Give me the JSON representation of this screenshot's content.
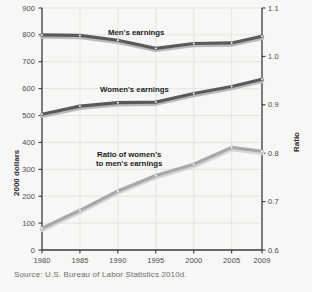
{
  "chart_data": {
    "type": "line",
    "title": "",
    "xlabel": "",
    "ylabel": "2000 dollars",
    "y2label": "Ratio",
    "x": [
      1980,
      1985,
      1990,
      1995,
      2000,
      2005,
      2009
    ],
    "xticklabels": [
      "1980",
      "1985",
      "1990",
      "1995",
      "2000",
      "2005",
      "2009"
    ],
    "xlim": [
      1980,
      2009
    ],
    "ylim": [
      0,
      900
    ],
    "yticks": [
      0,
      100,
      200,
      300,
      400,
      500,
      600,
      700,
      800,
      900
    ],
    "yticklabels": [
      "0",
      "100",
      "200",
      "300",
      "400",
      "500",
      "600",
      "700",
      "800",
      "900"
    ],
    "y2lim": [
      0.6,
      1.1
    ],
    "y2ticks": [
      0.6,
      0.7,
      0.8,
      0.9,
      1.0,
      1.1
    ],
    "y2ticklabels": [
      "0.6",
      "0.7",
      "0.8",
      "0.9",
      "1.0",
      "1.1"
    ],
    "grid": true,
    "legend_position": "inline-labels",
    "series": [
      {
        "name": "Men's earnings",
        "axis": "left",
        "color": "#5a5a5a",
        "values": [
          800,
          798,
          780,
          750,
          768,
          770,
          795
        ]
      },
      {
        "name": "Women's earnings",
        "axis": "left",
        "color": "#5a5a5a",
        "values": [
          505,
          535,
          548,
          550,
          582,
          608,
          635
        ]
      },
      {
        "name": "Ratio of women's to men's earnings",
        "axis": "right",
        "color": "#a8a8a8",
        "values": [
          0.645,
          0.682,
          0.722,
          0.754,
          0.777,
          0.812,
          0.804
        ]
      }
    ],
    "annotations": [
      {
        "text": "Men's earnings",
        "x": 1991.5,
        "y": 845
      },
      {
        "text": "Women's earnings",
        "x": 1990.5,
        "y": 607
      },
      {
        "text": "Ratio of women's",
        "x": 1990.0,
        "y": 390
      },
      {
        "text": "to men's earnings",
        "x": 1990.0,
        "y": 362
      }
    ]
  },
  "labels": {
    "y_axis_title": "2000 dollars",
    "y2_axis_title": "Ratio",
    "men_series_label": "Men's earnings",
    "women_series_label": "Women's earnings",
    "ratio_series_label_line1": "Ratio of women's",
    "ratio_series_label_line2": "to men's earnings"
  },
  "source": {
    "text": "Source:  U.S. Bureau of Labor Statistics 2010d."
  },
  "colors": {
    "background": "#f7f7f5",
    "axis": "#3a3a3a",
    "grid": "#e2e2de",
    "dark_series": "#5a5a5a",
    "light_series": "#a8a8a8",
    "tick_text": "#4a4a4a",
    "source_text": "#6b6b6b"
  }
}
